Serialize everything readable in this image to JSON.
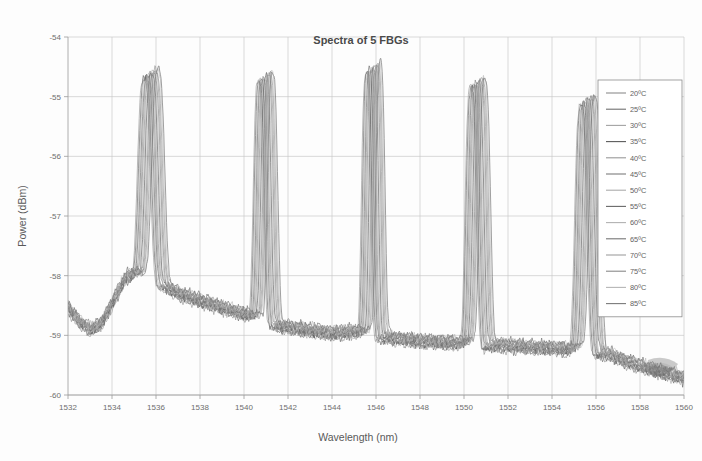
{
  "chart_data": {
    "type": "line",
    "title": "Spectra of 5 FBGs",
    "xlabel": "Wavelength (nm)",
    "ylabel": "Power (dBm)",
    "xlim": [
      1532,
      1560
    ],
    "ylim": [
      -60,
      -54
    ],
    "xticks": [
      1532,
      1534,
      1536,
      1538,
      1540,
      1542,
      1544,
      1546,
      1548,
      1550,
      1552,
      1554,
      1556,
      1558,
      1560
    ],
    "yticks": [
      -60,
      -59,
      -58,
      -57,
      -56,
      -55,
      -54
    ],
    "xtick_labels": [
      "1532",
      "1534",
      "1536",
      "1538",
      "1540",
      "1542",
      "1544",
      "1546",
      "1548",
      "1550",
      "1552",
      "1554",
      "1556",
      "1558",
      "1560"
    ],
    "ytick_labels": [
      "-60",
      "-59",
      "-58",
      "-57",
      "-56",
      "-55",
      "-54"
    ],
    "grid": "horizontal-and-vertical",
    "legend_position": "right-outside",
    "series": [
      {
        "name": "20ºC",
        "color": "#8c8c8c",
        "temperature_c": 20,
        "peak_shift_nm": 0.0
      },
      {
        "name": "25ºC",
        "color": "#6f6f6f",
        "temperature_c": 25,
        "peak_shift_nm": 0.05
      },
      {
        "name": "30ºC",
        "color": "#a3a3a3",
        "temperature_c": 30,
        "peak_shift_nm": 0.1
      },
      {
        "name": "35ºC",
        "color": "#5a5a5a",
        "temperature_c": 35,
        "peak_shift_nm": 0.15
      },
      {
        "name": "40ºC",
        "color": "#999999",
        "temperature_c": 40,
        "peak_shift_nm": 0.2
      },
      {
        "name": "45ºC",
        "color": "#7d7d7d",
        "temperature_c": 45,
        "peak_shift_nm": 0.25
      },
      {
        "name": "50ºC",
        "color": "#ababab",
        "temperature_c": 50,
        "peak_shift_nm": 0.3
      },
      {
        "name": "55ºC",
        "color": "#686868",
        "temperature_c": 55,
        "peak_shift_nm": 0.35
      },
      {
        "name": "60ºC",
        "color": "#b2b2b2",
        "temperature_c": 60,
        "peak_shift_nm": 0.4
      },
      {
        "name": "65ºC",
        "color": "#757575",
        "temperature_c": 65,
        "peak_shift_nm": 0.45
      },
      {
        "name": "70ºC",
        "color": "#9e9e9e",
        "temperature_c": 70,
        "peak_shift_nm": 0.5
      },
      {
        "name": "75ºC",
        "color": "#898989",
        "temperature_c": 75,
        "peak_shift_nm": 0.55
      },
      {
        "name": "80ºC",
        "color": "#b6b6b6",
        "temperature_c": 80,
        "peak_shift_nm": 0.6
      },
      {
        "name": "85ºC",
        "color": "#7a7a7a",
        "temperature_c": 85,
        "peak_shift_nm": 0.65
      }
    ],
    "peaks": [
      {
        "index": 1,
        "center_nm": 1535.45,
        "peak_power_dbm": -54.7,
        "width_nm": 0.7,
        "shoulder_power_dbm": -55.3
      },
      {
        "index": 2,
        "center_nm": 1540.65,
        "peak_power_dbm": -54.75,
        "width_nm": 0.55,
        "shoulder_power_dbm": -55.0
      },
      {
        "index": 3,
        "center_nm": 1545.55,
        "peak_power_dbm": -54.6,
        "width_nm": 0.5,
        "shoulder_power_dbm": -54.95
      },
      {
        "index": 4,
        "center_nm": 1550.3,
        "peak_power_dbm": -54.85,
        "width_nm": 0.6,
        "shoulder_power_dbm": -55.1
      },
      {
        "index": 5,
        "center_nm": 1555.3,
        "peak_power_dbm": -55.15,
        "width_nm": 0.65,
        "shoulder_power_dbm": -55.6
      }
    ],
    "baseline_profile": [
      {
        "x": 1532.0,
        "y": -58.62
      },
      {
        "x": 1532.5,
        "y": -58.85
      },
      {
        "x": 1533.0,
        "y": -58.98
      },
      {
        "x": 1533.5,
        "y": -58.9
      },
      {
        "x": 1534.0,
        "y": -58.55
      },
      {
        "x": 1534.6,
        "y": -58.12
      },
      {
        "x": 1535.0,
        "y": -58.05
      },
      {
        "x": 1536.2,
        "y": -58.22
      },
      {
        "x": 1537.0,
        "y": -58.38
      },
      {
        "x": 1538.0,
        "y": -58.5
      },
      {
        "x": 1539.0,
        "y": -58.62
      },
      {
        "x": 1540.0,
        "y": -58.72
      },
      {
        "x": 1541.2,
        "y": -58.88
      },
      {
        "x": 1542.0,
        "y": -58.95
      },
      {
        "x": 1543.0,
        "y": -59.0
      },
      {
        "x": 1544.0,
        "y": -59.05
      },
      {
        "x": 1545.0,
        "y": -59.02
      },
      {
        "x": 1546.2,
        "y": -59.1
      },
      {
        "x": 1547.0,
        "y": -59.14
      },
      {
        "x": 1548.0,
        "y": -59.18
      },
      {
        "x": 1549.0,
        "y": -59.2
      },
      {
        "x": 1550.8,
        "y": -59.24
      },
      {
        "x": 1552.0,
        "y": -59.26
      },
      {
        "x": 1553.0,
        "y": -59.28
      },
      {
        "x": 1554.0,
        "y": -59.3
      },
      {
        "x": 1555.9,
        "y": -59.35
      },
      {
        "x": 1556.6,
        "y": -59.4
      },
      {
        "x": 1557.4,
        "y": -59.52
      },
      {
        "x": 1558.2,
        "y": -59.62
      },
      {
        "x": 1559.0,
        "y": -59.7
      },
      {
        "x": 1560.0,
        "y": -59.8
      }
    ]
  }
}
